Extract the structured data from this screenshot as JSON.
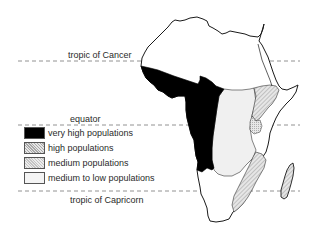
{
  "lines": {
    "tropic_of_cancer": {
      "label": "tropic of Cancer",
      "y": 61
    },
    "equator": {
      "label": "equator",
      "y": 125
    },
    "tropic_of_capricorn": {
      "label": "tropic of Capricorn",
      "y": 191
    }
  },
  "legend": {
    "items": [
      {
        "label": "very high populations",
        "fill": "#000000"
      },
      {
        "label": "high populations",
        "fill": "#c8c8c8"
      },
      {
        "label": "medium populations",
        "fill": "#dcdcdc"
      },
      {
        "label": "medium to low populations",
        "fill": "#f2f2f2"
      }
    ]
  },
  "colors": {
    "outline": "#1a1a1a",
    "dash": "#777777",
    "very_high": "#000000",
    "high": "#c8c8c8",
    "medium": "#dcdcdc",
    "medium_low": "#f0f0f0",
    "low": "#ffffff"
  }
}
